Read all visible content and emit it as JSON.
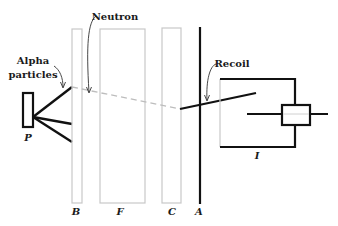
{
  "diagram": {
    "labels": {
      "alpha_line1": "Alpha",
      "alpha_line2": "particles",
      "neutron": "Neutron",
      "recoil": "Recoil",
      "source": "P",
      "beryllium": "B",
      "filter": "F",
      "chamber": "C",
      "absorber": "A",
      "ionization": "I"
    },
    "colors": {
      "ink": "#111111",
      "gray": "#c8c8c8",
      "dash": "#bdbdbd"
    }
  }
}
